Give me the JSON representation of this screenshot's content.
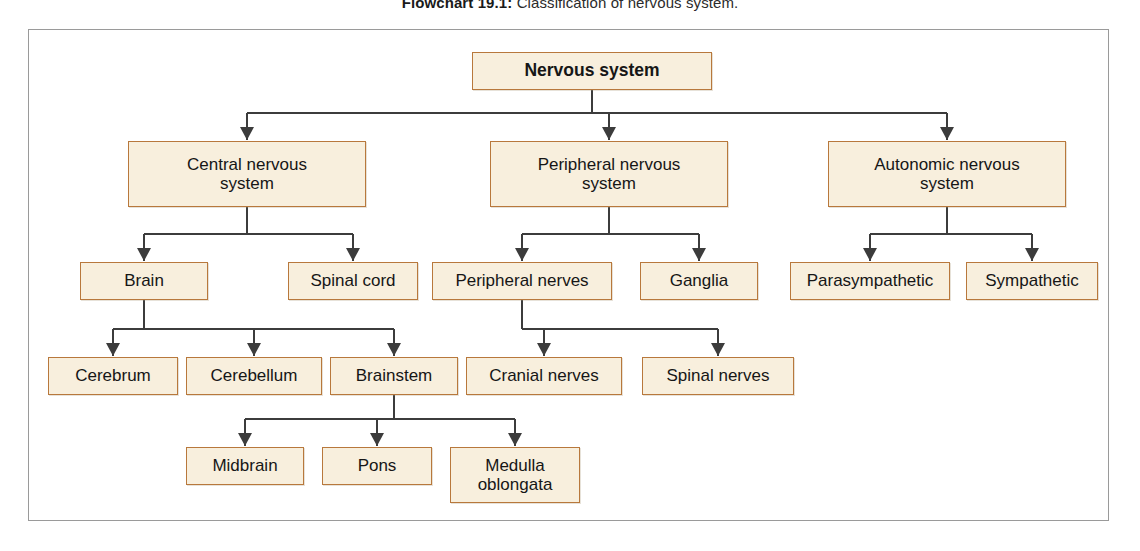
{
  "caption": {
    "label": "Flowchart 19.1:",
    "text": "Classification of nervous system."
  },
  "colors": {
    "node_fill": "#f8efdd",
    "node_border": "#b8783c",
    "connector": "#3c3c3c",
    "frame_border": "#9a9a9a",
    "text": "#161616"
  },
  "diagram_data": {
    "type": "flowchart",
    "title": "Classification of nervous system",
    "orientation": "top-down",
    "root": "Nervous system",
    "nodes": [
      {
        "id": "nervous-system",
        "label": "Nervous system",
        "lines": [
          "Nervous system"
        ],
        "level": 0,
        "x": 472,
        "y": 52,
        "w": 240,
        "h": 38,
        "bold": true
      },
      {
        "id": "central-nervous-system",
        "label": "Central nervous system",
        "lines": [
          "Central nervous",
          "system"
        ],
        "level": 1,
        "x": 128,
        "y": 141,
        "w": 238,
        "h": 66,
        "bold": false
      },
      {
        "id": "peripheral-nervous-system",
        "label": "Peripheral nervous system",
        "lines": [
          "Peripheral nervous",
          "system"
        ],
        "level": 1,
        "x": 490,
        "y": 141,
        "w": 238,
        "h": 66,
        "bold": false
      },
      {
        "id": "autonomic-nervous-system",
        "label": "Autonomic nervous system",
        "lines": [
          "Autonomic nervous",
          "system"
        ],
        "level": 1,
        "x": 828,
        "y": 141,
        "w": 238,
        "h": 66,
        "bold": false
      },
      {
        "id": "brain",
        "label": "Brain",
        "lines": [
          "Brain"
        ],
        "level": 2,
        "x": 80,
        "y": 262,
        "w": 128,
        "h": 38,
        "bold": false
      },
      {
        "id": "spinal-cord",
        "label": "Spinal cord",
        "lines": [
          "Spinal cord"
        ],
        "level": 2,
        "x": 288,
        "y": 262,
        "w": 130,
        "h": 38,
        "bold": false
      },
      {
        "id": "peripheral-nerves",
        "label": "Peripheral nerves",
        "lines": [
          "Peripheral nerves"
        ],
        "level": 2,
        "x": 432,
        "y": 262,
        "w": 180,
        "h": 38,
        "bold": false
      },
      {
        "id": "ganglia",
        "label": "Ganglia",
        "lines": [
          "Ganglia"
        ],
        "level": 2,
        "x": 640,
        "y": 262,
        "w": 118,
        "h": 38,
        "bold": false
      },
      {
        "id": "parasympathetic",
        "label": "Parasympathetic",
        "lines": [
          "Parasympathetic"
        ],
        "level": 2,
        "x": 790,
        "y": 262,
        "w": 160,
        "h": 38,
        "bold": false
      },
      {
        "id": "sympathetic",
        "label": "Sympathetic",
        "lines": [
          "Sympathetic"
        ],
        "level": 2,
        "x": 966,
        "y": 262,
        "w": 132,
        "h": 38,
        "bold": false
      },
      {
        "id": "cerebrum",
        "label": "Cerebrum",
        "lines": [
          "Cerebrum"
        ],
        "level": 3,
        "x": 48,
        "y": 357,
        "w": 130,
        "h": 38,
        "bold": false
      },
      {
        "id": "cerebellum",
        "label": "Cerebellum",
        "lines": [
          "Cerebellum"
        ],
        "level": 3,
        "x": 186,
        "y": 357,
        "w": 136,
        "h": 38,
        "bold": false
      },
      {
        "id": "brainstem",
        "label": "Brainstem",
        "lines": [
          "Brainstem"
        ],
        "level": 3,
        "x": 330,
        "y": 357,
        "w": 128,
        "h": 38,
        "bold": false
      },
      {
        "id": "cranial-nerves",
        "label": "Cranial nerves",
        "lines": [
          "Cranial nerves"
        ],
        "level": 3,
        "x": 466,
        "y": 357,
        "w": 156,
        "h": 38,
        "bold": false
      },
      {
        "id": "spinal-nerves",
        "label": "Spinal nerves",
        "lines": [
          "Spinal nerves"
        ],
        "level": 3,
        "x": 642,
        "y": 357,
        "w": 152,
        "h": 38,
        "bold": false
      },
      {
        "id": "midbrain",
        "label": "Midbrain",
        "lines": [
          "Midbrain"
        ],
        "level": 4,
        "x": 186,
        "y": 447,
        "w": 118,
        "h": 38,
        "bold": false
      },
      {
        "id": "pons",
        "label": "Pons",
        "lines": [
          "Pons"
        ],
        "level": 4,
        "x": 322,
        "y": 447,
        "w": 110,
        "h": 38,
        "bold": false
      },
      {
        "id": "medulla-oblongata",
        "label": "Medulla oblongata",
        "lines": [
          "Medulla",
          "oblongata"
        ],
        "level": 4,
        "x": 450,
        "y": 447,
        "w": 130,
        "h": 56,
        "bold": false
      }
    ],
    "edges": [
      {
        "from": "nervous-system",
        "to": "central-nervous-system"
      },
      {
        "from": "nervous-system",
        "to": "peripheral-nervous-system"
      },
      {
        "from": "nervous-system",
        "to": "autonomic-nervous-system"
      },
      {
        "from": "central-nervous-system",
        "to": "brain"
      },
      {
        "from": "central-nervous-system",
        "to": "spinal-cord"
      },
      {
        "from": "peripheral-nervous-system",
        "to": "peripheral-nerves"
      },
      {
        "from": "peripheral-nervous-system",
        "to": "ganglia"
      },
      {
        "from": "autonomic-nervous-system",
        "to": "parasympathetic"
      },
      {
        "from": "autonomic-nervous-system",
        "to": "sympathetic"
      },
      {
        "from": "brain",
        "to": "cerebrum"
      },
      {
        "from": "brain",
        "to": "cerebellum"
      },
      {
        "from": "brain",
        "to": "brainstem"
      },
      {
        "from": "peripheral-nerves",
        "to": "cranial-nerves"
      },
      {
        "from": "peripheral-nerves",
        "to": "spinal-nerves"
      },
      {
        "from": "brainstem",
        "to": "midbrain"
      },
      {
        "from": "brainstem",
        "to": "pons"
      },
      {
        "from": "brainstem",
        "to": "medulla-oblongata"
      }
    ]
  }
}
